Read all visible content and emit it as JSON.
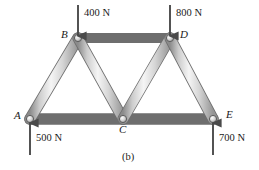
{
  "figure": {
    "caption": "(b)",
    "type": "truss-free-body-diagram",
    "background_color": "#ffffff",
    "member_color": "#b9b9b9",
    "member_highlight_color": "#f2f2f2",
    "member_edge_color": "#6e6e6e",
    "arrow_color": "#4a4a4a",
    "text_color": "#1a1a1a"
  },
  "joints": [
    {
      "id": "A",
      "label": "A",
      "x": 30,
      "y": 119,
      "label_x": 14,
      "label_y": 112
    },
    {
      "id": "B",
      "label": "B",
      "x": 78,
      "y": 38,
      "label_x": 61,
      "label_y": 30
    },
    {
      "id": "C",
      "label": "C",
      "x": 123,
      "y": 119,
      "label_x": 119,
      "label_y": 126
    },
    {
      "id": "D",
      "label": "D",
      "x": 170,
      "y": 38,
      "label_x": 180,
      "label_y": 31
    },
    {
      "id": "E",
      "label": "E",
      "x": 213,
      "y": 119,
      "label_x": 226,
      "label_y": 111
    }
  ],
  "members": [
    {
      "id": "AB",
      "from": "A",
      "to": "B"
    },
    {
      "id": "BD",
      "from": "B",
      "to": "D"
    },
    {
      "id": "BC",
      "from": "B",
      "to": "C"
    },
    {
      "id": "CD",
      "from": "C",
      "to": "D"
    },
    {
      "id": "DE",
      "from": "D",
      "to": "E"
    },
    {
      "id": "AC",
      "from": "A",
      "to": "C"
    },
    {
      "id": "CE",
      "from": "C",
      "to": "E"
    }
  ],
  "loads": [
    {
      "id": "load-400N-at-B",
      "label": "400 N",
      "magnitude": 400,
      "unit": "N",
      "direction": "down",
      "at_joint": "B",
      "arrow_x": 78,
      "arrow_tail_y": 5,
      "arrow_tip_y": 36,
      "label_x": 84,
      "label_y": 9
    },
    {
      "id": "load-800N-at-D",
      "label": "800 N",
      "magnitude": 800,
      "unit": "N",
      "direction": "down",
      "at_joint": "D",
      "arrow_x": 170,
      "arrow_tail_y": 5,
      "arrow_tip_y": 36,
      "label_x": 176,
      "label_y": 9
    }
  ],
  "reactions": [
    {
      "id": "reaction-500N-at-A",
      "label": "500 N",
      "magnitude": 500,
      "unit": "N",
      "direction": "up",
      "at_joint": "A",
      "arrow_x": 30,
      "arrow_tail_y": 155,
      "arrow_tip_y": 123,
      "label_x": 36,
      "label_y": 134
    },
    {
      "id": "reaction-700N-at-E",
      "label": "700 N",
      "magnitude": 700,
      "unit": "N",
      "direction": "up",
      "at_joint": "E",
      "arrow_x": 213,
      "arrow_tail_y": 155,
      "arrow_tip_y": 123,
      "label_x": 219,
      "label_y": 134
    }
  ],
  "caption": {
    "text": "(b)",
    "x": 122,
    "y": 152
  }
}
